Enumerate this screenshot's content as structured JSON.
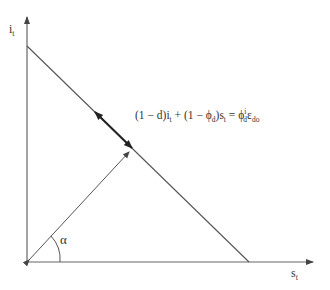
{
  "diagram": {
    "y_axis": {
      "label_main": "i",
      "label_sub": "t"
    },
    "x_axis": {
      "label_main": "s",
      "label_sub": "t"
    },
    "angle_label": "α",
    "equation": {
      "part1": "(1 − d)i",
      "part1_sub": "t",
      "part2": " + (1 − ϕ",
      "part2_sub": "d",
      "part3": ")s",
      "part3_sub": "t",
      "part4": " = ϕ",
      "part4_sup": "i",
      "part4_sub": "d",
      "part5": "ε",
      "part5_sub": "do"
    },
    "colors": {
      "line": "#555555",
      "thick_arrow": "#222222",
      "text": "#333333"
    }
  }
}
